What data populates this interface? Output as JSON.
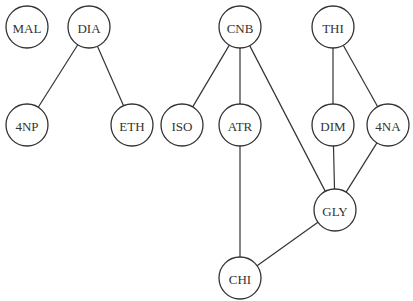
{
  "diagram": {
    "type": "graph",
    "node_radius": 21,
    "colors": {
      "stroke": "#333333",
      "fill": "#ffffff",
      "text": "#333333",
      "background": "#ffffff"
    },
    "nodes": [
      {
        "id": "MAL",
        "label": "MAL",
        "x": 27,
        "y": 27
      },
      {
        "id": "DIA",
        "label": "DIA",
        "x": 89,
        "y": 27
      },
      {
        "id": "CNB",
        "label": "CNB",
        "x": 240,
        "y": 27
      },
      {
        "id": "THI",
        "label": "THI",
        "x": 333,
        "y": 27
      },
      {
        "id": "4NP",
        "label": "4NP",
        "x": 27,
        "y": 125
      },
      {
        "id": "ETH",
        "label": "ETH",
        "x": 132,
        "y": 125
      },
      {
        "id": "ISO",
        "label": "ISO",
        "x": 182,
        "y": 125
      },
      {
        "id": "ATR",
        "label": "ATR",
        "x": 240,
        "y": 125
      },
      {
        "id": "DIM",
        "label": "DIM",
        "x": 333,
        "y": 125
      },
      {
        "id": "4NA",
        "label": "4NA",
        "x": 388,
        "y": 125
      },
      {
        "id": "GLY",
        "label": "GLY",
        "x": 335,
        "y": 210
      },
      {
        "id": "CHI",
        "label": "CHI",
        "x": 240,
        "y": 278
      }
    ],
    "edges": [
      {
        "from": "DIA",
        "to": "4NP"
      },
      {
        "from": "DIA",
        "to": "ETH"
      },
      {
        "from": "CNB",
        "to": "ISO"
      },
      {
        "from": "CNB",
        "to": "ATR"
      },
      {
        "from": "CNB",
        "to": "GLY"
      },
      {
        "from": "THI",
        "to": "DIM"
      },
      {
        "from": "THI",
        "to": "4NA"
      },
      {
        "from": "DIM",
        "to": "GLY"
      },
      {
        "from": "4NA",
        "to": "GLY"
      },
      {
        "from": "ATR",
        "to": "CHI"
      },
      {
        "from": "GLY",
        "to": "CHI"
      }
    ]
  }
}
